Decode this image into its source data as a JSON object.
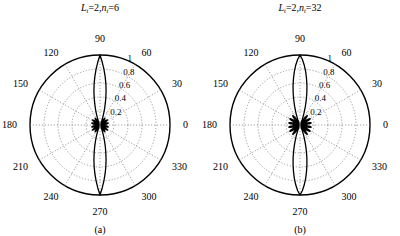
{
  "figure": {
    "background": "#ffffff",
    "line_color": "#000000",
    "grid_color": "#777777"
  },
  "panels": [
    {
      "id": "panel-a",
      "caption": "(a)",
      "title": {
        "full": "L_t=2,n_t=6",
        "var1": "L",
        "var1_sub": "t",
        "var1_value": "2",
        "var2": "n",
        "var2_sub": "t",
        "var2_value": "6",
        "separator": ",",
        "equals": "="
      },
      "chart_data": {
        "type": "line",
        "plot_kind": "polar",
        "title": "L_t=2,n_t=6",
        "xlabel": "angle (degrees)",
        "ylabel": "normalized magnitude",
        "angle_unit": "degrees",
        "angle_ticks": [
          0,
          30,
          60,
          90,
          120,
          150,
          180,
          210,
          240,
          270,
          300,
          330
        ],
        "angle_tick_labels": [
          "0",
          "30",
          "60",
          "90",
          "120",
          "150",
          "180",
          "210",
          "240",
          "270",
          "300",
          "330"
        ],
        "radial_ticks": [
          0.2,
          0.4,
          0.6,
          0.8,
          1
        ],
        "radial_tick_labels": [
          "0.2",
          "0.4",
          "0.6",
          "0.8",
          "1"
        ],
        "rlim": [
          0,
          1
        ],
        "grid": true,
        "legend": "none",
        "series": [
          {
            "name": "beampattern",
            "theta": [
              0,
              2,
              4,
              6,
              8,
              10,
              12,
              14,
              16,
              18,
              20,
              22,
              24,
              26,
              28,
              30,
              32,
              34,
              36,
              38,
              40,
              42,
              44,
              46,
              48,
              50,
              52,
              54,
              56,
              58,
              60,
              62,
              64,
              66,
              68,
              70,
              72,
              74,
              76,
              78,
              80,
              82,
              84,
              86,
              88,
              90,
              92,
              94,
              96,
              98,
              100,
              102,
              104,
              106,
              108,
              110,
              112,
              114,
              116,
              118,
              120,
              122,
              124,
              126,
              128,
              130,
              132,
              134,
              136,
              138,
              140,
              142,
              144,
              146,
              148,
              150,
              152,
              154,
              156,
              158,
              160,
              162,
              164,
              166,
              168,
              170,
              172,
              174,
              176,
              178,
              180,
              182,
              184,
              186,
              188,
              190,
              192,
              194,
              196,
              198,
              200,
              202,
              204,
              206,
              208,
              210,
              212,
              214,
              216,
              218,
              220,
              222,
              224,
              226,
              228,
              230,
              232,
              234,
              236,
              238,
              240,
              242,
              244,
              246,
              248,
              250,
              252,
              254,
              256,
              258,
              260,
              262,
              264,
              266,
              268,
              270,
              272,
              274,
              276,
              278,
              280,
              282,
              284,
              286,
              288,
              290,
              292,
              294,
              296,
              298,
              300,
              302,
              304,
              306,
              308,
              310,
              312,
              314,
              316,
              318,
              320,
              322,
              324,
              326,
              328,
              330,
              332,
              334,
              336,
              338,
              340,
              342,
              344,
              346,
              348,
              350,
              352,
              354,
              356,
              358
            ],
            "r": [
              0.02,
              0.03,
              0.05,
              0.07,
              0.09,
              0.11,
              0.12,
              0.12,
              0.11,
              0.09,
              0.06,
              0.03,
              0.02,
              0.04,
              0.07,
              0.1,
              0.12,
              0.13,
              0.12,
              0.1,
              0.07,
              0.04,
              0.02,
              0.03,
              0.06,
              0.09,
              0.11,
              0.12,
              0.11,
              0.09,
              0.06,
              0.04,
              0.03,
              0.04,
              0.07,
              0.11,
              0.16,
              0.23,
              0.31,
              0.4,
              0.5,
              0.6,
              0.7,
              0.8,
              0.9,
              1.0,
              0.9,
              0.8,
              0.7,
              0.6,
              0.5,
              0.4,
              0.31,
              0.23,
              0.16,
              0.11,
              0.07,
              0.04,
              0.03,
              0.04,
              0.06,
              0.09,
              0.11,
              0.12,
              0.11,
              0.09,
              0.06,
              0.03,
              0.02,
              0.04,
              0.07,
              0.1,
              0.12,
              0.13,
              0.12,
              0.1,
              0.07,
              0.04,
              0.02,
              0.03,
              0.06,
              0.09,
              0.11,
              0.12,
              0.12,
              0.11,
              0.09,
              0.07,
              0.05,
              0.03,
              0.02,
              0.03,
              0.05,
              0.07,
              0.09,
              0.11,
              0.12,
              0.12,
              0.11,
              0.09,
              0.06,
              0.03,
              0.02,
              0.04,
              0.07,
              0.1,
              0.12,
              0.13,
              0.12,
              0.1,
              0.07,
              0.04,
              0.02,
              0.03,
              0.06,
              0.09,
              0.11,
              0.12,
              0.11,
              0.09,
              0.06,
              0.04,
              0.03,
              0.04,
              0.07,
              0.11,
              0.16,
              0.23,
              0.31,
              0.4,
              0.5,
              0.6,
              0.7,
              0.8,
              0.9,
              1.0,
              0.9,
              0.8,
              0.7,
              0.6,
              0.5,
              0.4,
              0.31,
              0.23,
              0.16,
              0.11,
              0.07,
              0.04,
              0.03,
              0.04,
              0.06,
              0.09,
              0.11,
              0.12,
              0.11,
              0.09,
              0.06,
              0.03,
              0.02,
              0.04,
              0.07,
              0.1,
              0.12,
              0.13,
              0.12,
              0.1,
              0.07,
              0.04,
              0.02,
              0.03,
              0.06,
              0.09,
              0.11,
              0.12,
              0.12,
              0.11,
              0.09,
              0.07,
              0.05,
              0.03
            ]
          }
        ]
      }
    },
    {
      "id": "panel-b",
      "caption": "(b)",
      "title": {
        "full": "L_t=2,n_t=32",
        "var1": "L",
        "var1_sub": "t",
        "var1_value": "2",
        "var2": "n",
        "var2_sub": "t",
        "var2_value": "32",
        "separator": ",",
        "equals": "="
      },
      "chart_data": {
        "type": "line",
        "plot_kind": "polar",
        "title": "L_t=2,n_t=32",
        "xlabel": "angle (degrees)",
        "ylabel": "normalized magnitude",
        "angle_unit": "degrees",
        "angle_ticks": [
          0,
          30,
          60,
          90,
          120,
          150,
          180,
          210,
          240,
          270,
          300,
          330
        ],
        "angle_tick_labels": [
          "0",
          "30",
          "60",
          "90",
          "120",
          "150",
          "180",
          "210",
          "240",
          "270",
          "300",
          "330"
        ],
        "radial_ticks": [
          0.2,
          0.4,
          0.6,
          0.8,
          1
        ],
        "radial_tick_labels": [
          "0.2",
          "0.4",
          "0.6",
          "0.8",
          "1"
        ],
        "rlim": [
          0,
          1
        ],
        "grid": true,
        "legend": "none",
        "series": [
          {
            "name": "beampattern",
            "theta": [
              0,
              2,
              4,
              6,
              8,
              10,
              12,
              14,
              16,
              18,
              20,
              22,
              24,
              26,
              28,
              30,
              32,
              34,
              36,
              38,
              40,
              42,
              44,
              46,
              48,
              50,
              52,
              54,
              56,
              58,
              60,
              62,
              64,
              66,
              68,
              70,
              72,
              74,
              76,
              78,
              80,
              82,
              84,
              86,
              88,
              90,
              92,
              94,
              96,
              98,
              100,
              102,
              104,
              106,
              108,
              110,
              112,
              114,
              116,
              118,
              120,
              122,
              124,
              126,
              128,
              130,
              132,
              134,
              136,
              138,
              140,
              142,
              144,
              146,
              148,
              150,
              152,
              154,
              156,
              158,
              160,
              162,
              164,
              166,
              168,
              170,
              172,
              174,
              176,
              178,
              180,
              182,
              184,
              186,
              188,
              190,
              192,
              194,
              196,
              198,
              200,
              202,
              204,
              206,
              208,
              210,
              212,
              214,
              216,
              218,
              220,
              222,
              224,
              226,
              228,
              230,
              232,
              234,
              236,
              238,
              240,
              242,
              244,
              246,
              248,
              250,
              252,
              254,
              256,
              258,
              260,
              262,
              264,
              266,
              268,
              270,
              272,
              274,
              276,
              278,
              280,
              282,
              284,
              286,
              288,
              290,
              292,
              294,
              296,
              298,
              300,
              302,
              304,
              306,
              308,
              310,
              312,
              314,
              316,
              318,
              320,
              322,
              324,
              326,
              328,
              330,
              332,
              334,
              336,
              338,
              340,
              342,
              344,
              346,
              348,
              350,
              352,
              354,
              356,
              358
            ],
            "r": [
              0.02,
              0.04,
              0.07,
              0.11,
              0.14,
              0.16,
              0.16,
              0.14,
              0.11,
              0.07,
              0.03,
              0.02,
              0.05,
              0.09,
              0.13,
              0.16,
              0.17,
              0.16,
              0.13,
              0.09,
              0.05,
              0.02,
              0.03,
              0.07,
              0.11,
              0.15,
              0.17,
              0.16,
              0.14,
              0.1,
              0.06,
              0.03,
              0.03,
              0.05,
              0.09,
              0.14,
              0.2,
              0.28,
              0.37,
              0.47,
              0.57,
              0.67,
              0.77,
              0.86,
              0.94,
              1.0,
              0.94,
              0.86,
              0.77,
              0.67,
              0.57,
              0.47,
              0.37,
              0.28,
              0.2,
              0.14,
              0.09,
              0.05,
              0.03,
              0.03,
              0.06,
              0.1,
              0.14,
              0.16,
              0.17,
              0.15,
              0.11,
              0.07,
              0.03,
              0.02,
              0.05,
              0.09,
              0.13,
              0.16,
              0.17,
              0.16,
              0.13,
              0.09,
              0.05,
              0.02,
              0.03,
              0.07,
              0.11,
              0.14,
              0.16,
              0.16,
              0.14,
              0.11,
              0.07,
              0.04,
              0.02,
              0.04,
              0.07,
              0.11,
              0.14,
              0.16,
              0.16,
              0.14,
              0.11,
              0.07,
              0.03,
              0.02,
              0.05,
              0.09,
              0.13,
              0.16,
              0.17,
              0.16,
              0.13,
              0.09,
              0.05,
              0.02,
              0.03,
              0.07,
              0.11,
              0.15,
              0.17,
              0.16,
              0.14,
              0.1,
              0.06,
              0.03,
              0.03,
              0.05,
              0.09,
              0.14,
              0.2,
              0.28,
              0.37,
              0.47,
              0.57,
              0.67,
              0.77,
              0.86,
              0.94,
              1.0,
              0.94,
              0.86,
              0.77,
              0.67,
              0.57,
              0.47,
              0.37,
              0.28,
              0.2,
              0.14,
              0.09,
              0.05,
              0.03,
              0.03,
              0.06,
              0.1,
              0.14,
              0.16,
              0.17,
              0.15,
              0.11,
              0.07,
              0.03,
              0.02,
              0.05,
              0.09,
              0.13,
              0.16,
              0.17,
              0.16,
              0.13,
              0.09,
              0.05,
              0.02,
              0.03,
              0.07,
              0.11,
              0.14,
              0.16,
              0.16,
              0.14,
              0.11,
              0.07,
              0.04
            ]
          }
        ]
      }
    }
  ]
}
